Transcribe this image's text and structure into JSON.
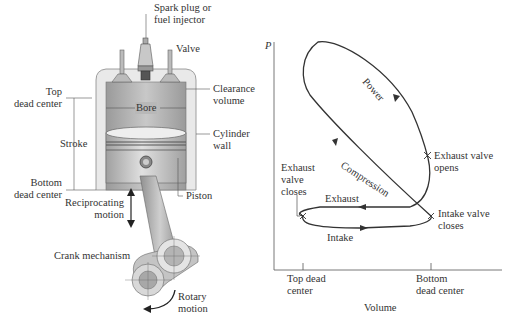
{
  "engine": {
    "labels": {
      "spark_plug": [
        "Spark plug or",
        "fuel injector"
      ],
      "valve": "Valve",
      "top_dead_center": [
        "Top",
        "dead center"
      ],
      "clearance_volume": [
        "Clearance",
        "volume"
      ],
      "bore": "Bore",
      "stroke": "Stroke",
      "cylinder_wall": [
        "Cylinder",
        "wall"
      ],
      "bottom_dead_center": [
        "Bottom",
        "dead center"
      ],
      "reciprocating_motion": [
        "Reciprocating",
        "motion"
      ],
      "piston": "Piston",
      "crank_mechanism": "Crank mechanism",
      "rotary_motion": [
        "Rotary",
        "motion"
      ]
    }
  },
  "pv_diagram": {
    "y_axis_label": "P",
    "x_axis_label": "Volume",
    "x_ticks": [
      [
        "Top dead",
        "center"
      ],
      [
        "Bottom",
        "dead center"
      ]
    ],
    "process_labels": {
      "power": "Power",
      "compression": "Compression",
      "exhaust": "Exhaust",
      "intake": "Intake"
    },
    "event_labels": {
      "exhaust_valve_opens": [
        "Exhaust valve",
        "opens"
      ],
      "exhaust_valve_closes": [
        "Exhaust",
        "valve",
        "closes"
      ],
      "intake_valve_closes": [
        "Intake valve",
        "closes"
      ]
    }
  },
  "colors": {
    "cylinder_outer": "#e6e6e6",
    "cylinder_inner": "#a8a8a8",
    "piston": "#c9c9c9",
    "rod": "#b5b5b5",
    "line": "#333333"
  }
}
